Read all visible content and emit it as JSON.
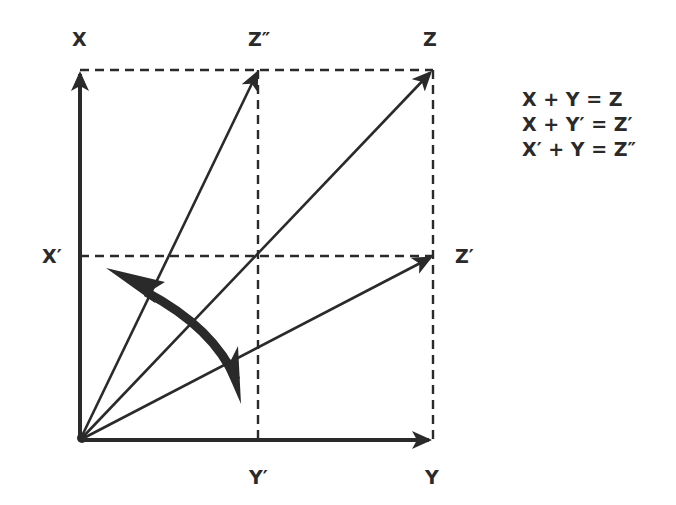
{
  "diagram": {
    "type": "vector-addition-parallelogram",
    "labels": {
      "x_axis": "X",
      "y_axis": "Y",
      "x_prime": "X′",
      "y_prime": "Y′",
      "z": "Z",
      "z_prime": "Z′",
      "z_double_prime": "Z″"
    },
    "equations": [
      "X + Y = Z",
      "X + Y′ = Z′",
      "X′ + Y = Z″"
    ],
    "vectors": [
      {
        "name": "X",
        "from": "origin",
        "to": "X"
      },
      {
        "name": "Y",
        "from": "origin",
        "to": "Y"
      },
      {
        "name": "Z",
        "from": "origin",
        "to": "Z"
      },
      {
        "name": "Z′",
        "from": "origin",
        "to": "Z′"
      },
      {
        "name": "Z″",
        "from": "origin",
        "to": "Z″"
      }
    ],
    "annotations": {
      "rotation_arrow": "double-headed curved arrow indicating rotation between Z″ and Z′"
    },
    "colors": {
      "ink": "#2a2a2a",
      "background": "#ffffff"
    }
  }
}
